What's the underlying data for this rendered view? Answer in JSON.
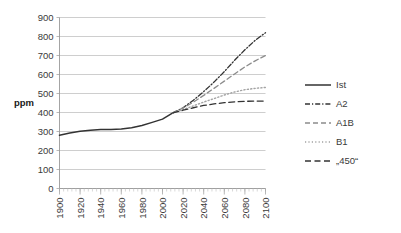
{
  "chart_data": {
    "type": "line",
    "title": "",
    "xlabel": "",
    "ylabel": "ppm",
    "xlim": [
      1900,
      2100
    ],
    "ylim": [
      0,
      900
    ],
    "ytick_step": 100,
    "xtick_step": 20,
    "grid": "horizontal",
    "legend_position": "right",
    "xticks": [
      "1900",
      "1920",
      "1940",
      "1960",
      "1980",
      "2000",
      "2020",
      "2040",
      "2060",
      "2080",
      "2100"
    ],
    "yticks": [
      "0",
      "100",
      "200",
      "300",
      "400",
      "500",
      "600",
      "700",
      "800",
      "900"
    ],
    "series": [
      {
        "name": "Ist",
        "style": "solid",
        "color": "#333333",
        "x": [
          1900,
          1910,
          1920,
          1930,
          1940,
          1950,
          1960,
          1970,
          1980,
          1990,
          2000,
          2010
        ],
        "values": [
          280,
          292,
          301,
          306,
          310,
          311,
          313,
          320,
          332,
          348,
          365,
          398
        ]
      },
      {
        "name": "A2",
        "style": "dash-dot",
        "color": "#333333",
        "x": [
          2010,
          2020,
          2030,
          2040,
          2050,
          2060,
          2070,
          2080,
          2090,
          2100
        ],
        "values": [
          398,
          425,
          465,
          510,
          560,
          615,
          675,
          730,
          780,
          820
        ]
      },
      {
        "name": "A1B",
        "style": "dashed",
        "color": "#8c8c8c",
        "x": [
          2010,
          2020,
          2030,
          2040,
          2050,
          2060,
          2070,
          2080,
          2090,
          2100
        ],
        "values": [
          398,
          423,
          455,
          490,
          527,
          565,
          603,
          640,
          672,
          700
        ]
      },
      {
        "name": "B1",
        "style": "dotted",
        "color": "#a3a3a3",
        "x": [
          2010,
          2020,
          2030,
          2040,
          2050,
          2060,
          2070,
          2080,
          2090,
          2100
        ],
        "values": [
          398,
          415,
          435,
          455,
          473,
          492,
          508,
          520,
          527,
          532
        ]
      },
      {
        "name": "„450“",
        "style": "long-dash",
        "color": "#333333",
        "x": [
          2010,
          2020,
          2030,
          2040,
          2050,
          2060,
          2070,
          2080,
          2090,
          2100
        ],
        "values": [
          398,
          412,
          425,
          437,
          445,
          452,
          456,
          459,
          460,
          460
        ]
      }
    ]
  },
  "legend": {
    "items": [
      {
        "label": "Ist"
      },
      {
        "label": "A2"
      },
      {
        "label": "A1B"
      },
      {
        "label": "B1"
      },
      {
        "label": "„450“"
      }
    ]
  },
  "axes": {
    "y_title": "ppm"
  },
  "colors": {
    "grid": "#b9b9b9",
    "axis": "#9a9a9a",
    "ist": "#333333",
    "a2": "#333333",
    "a1b": "#8c8c8c",
    "b1": "#a3a3a3",
    "target450": "#333333"
  }
}
